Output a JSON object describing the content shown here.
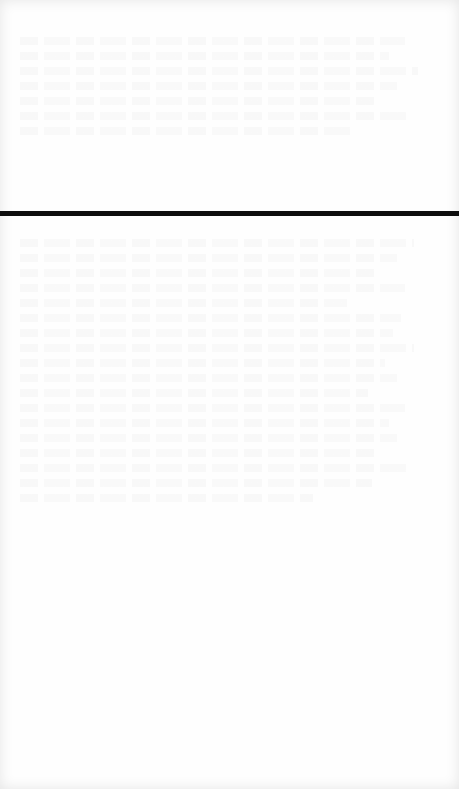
{
  "page": {
    "type": "scanned-blank-page",
    "background_color": "#fefefe",
    "bleed_through_text": "illegible",
    "divider": {
      "color": "#0e0e0e",
      "top_px": 211,
      "thickness_px": 5
    }
  }
}
